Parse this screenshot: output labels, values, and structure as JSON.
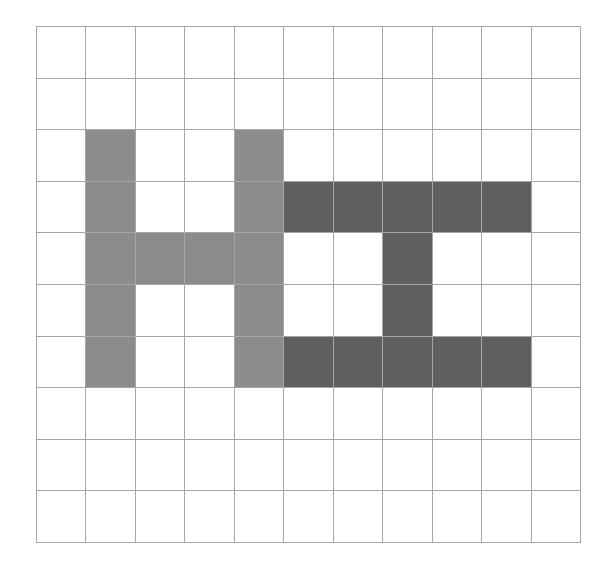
{
  "grid": {
    "rows": 10,
    "cols": 11,
    "line_color": "#a6a6a6",
    "empty_color": "#ffffff"
  },
  "shapes": [
    {
      "name": "H-shape",
      "color": "#8c8c8c",
      "cells": [
        [
          2,
          1
        ],
        [
          3,
          1
        ],
        [
          4,
          1
        ],
        [
          5,
          1
        ],
        [
          6,
          1
        ],
        [
          4,
          2
        ],
        [
          4,
          3
        ],
        [
          2,
          4
        ],
        [
          3,
          4
        ],
        [
          4,
          4
        ],
        [
          5,
          4
        ],
        [
          6,
          4
        ]
      ]
    },
    {
      "name": "I-beam-shape",
      "color": "#5f5f5f",
      "cells": [
        [
          3,
          5
        ],
        [
          3,
          6
        ],
        [
          3,
          7
        ],
        [
          3,
          8
        ],
        [
          3,
          9
        ],
        [
          4,
          7
        ],
        [
          5,
          7
        ],
        [
          6,
          5
        ],
        [
          6,
          6
        ],
        [
          6,
          7
        ],
        [
          6,
          8
        ],
        [
          6,
          9
        ]
      ]
    }
  ]
}
